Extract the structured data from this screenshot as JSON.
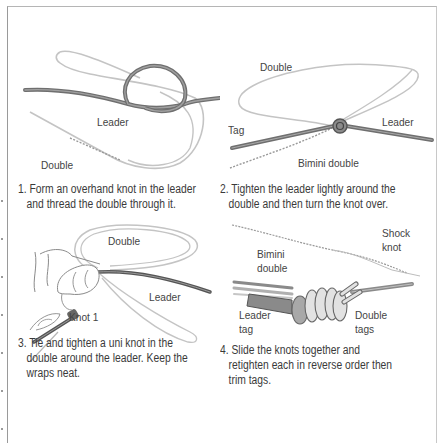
{
  "steps": [
    {
      "number": "1.",
      "caption_line1": "Form an overhand knot in the leader",
      "caption_line2": "and thread the double through it.",
      "caption_line3": "",
      "labels": {
        "leader": "Leader",
        "double": "Double"
      }
    },
    {
      "number": "2.",
      "caption_line1": "Tighten the leader lightly around the",
      "caption_line2": "double and then turn the knot over.",
      "caption_line3": "",
      "labels": {
        "double": "Double",
        "tag": "Tag",
        "leader": "Leader",
        "bimini_double": "Bimini double"
      }
    },
    {
      "number": "3.",
      "caption_line1": "Tie and tighten a uni knot in the",
      "caption_line2": "double around the leader. Keep the",
      "caption_line3": "wraps neat.",
      "labels": {
        "double": "Double",
        "leader": "Leader",
        "knot1": "Knot 1"
      }
    },
    {
      "number": "4.",
      "caption_line1": "Slide the knots together and",
      "caption_line2": "retighten each in reverse order then",
      "caption_line3": "trim tags.",
      "labels": {
        "bimini_line1": "Bimini",
        "bimini_line2": "double",
        "shock_line1": "Shock",
        "shock_line2": "knot",
        "leader_tag_line1": "Leader",
        "leader_tag_line2": "tag",
        "double_tags_line1": "Double",
        "double_tags_line2": "tags"
      }
    }
  ],
  "colors": {
    "leader_line": "#6f6f6f",
    "leader_line_light": "#a8a8a8",
    "double_line": "#b8b8b8",
    "text": "#3a3a3a",
    "frame": "#9a9a9a"
  }
}
